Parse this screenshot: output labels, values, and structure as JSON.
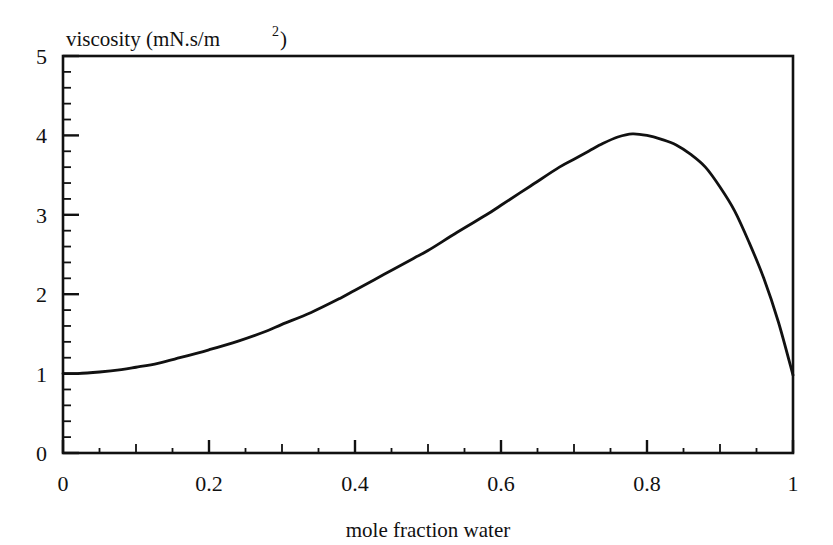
{
  "chart_data": {
    "type": "line",
    "title_main": "viscosity (mN.s/m",
    "title_sup": "2",
    "title_tail": ")",
    "xlabel": "mole fraction water",
    "ylabel": "viscosity (mN.s/m2)",
    "xlim": [
      0,
      1
    ],
    "ylim": [
      0,
      5
    ],
    "grid": false,
    "legend": "none",
    "line_color": "#111111",
    "background_color": "#ffffff",
    "frame_color": "#111111",
    "xticks": [
      0,
      0.2,
      0.4,
      0.6,
      0.8,
      1
    ],
    "xtick_labels": [
      "0",
      "0.2",
      "0.4",
      "0.6",
      "0.8",
      "1"
    ],
    "xminor_step": 0.05,
    "yticks": [
      0,
      1,
      2,
      3,
      4,
      5
    ],
    "ytick_labels": [
      "0",
      "1",
      "2",
      "3",
      "4",
      "5"
    ],
    "yminor_step": 0.2,
    "series": [
      {
        "name": "viscosity",
        "x": [
          0.0,
          0.02,
          0.05,
          0.08,
          0.1,
          0.13,
          0.16,
          0.2,
          0.24,
          0.28,
          0.3,
          0.34,
          0.38,
          0.4,
          0.44,
          0.48,
          0.5,
          0.54,
          0.58,
          0.6,
          0.64,
          0.68,
          0.7,
          0.72,
          0.74,
          0.76,
          0.78,
          0.8,
          0.82,
          0.84,
          0.86,
          0.88,
          0.9,
          0.92,
          0.94,
          0.96,
          0.98,
          1.0
        ],
        "y": [
          1.0,
          1.0,
          1.02,
          1.05,
          1.08,
          1.13,
          1.2,
          1.3,
          1.41,
          1.54,
          1.62,
          1.77,
          1.95,
          2.05,
          2.25,
          2.45,
          2.55,
          2.78,
          3.0,
          3.12,
          3.36,
          3.6,
          3.7,
          3.8,
          3.9,
          3.98,
          4.02,
          4.0,
          3.95,
          3.88,
          3.76,
          3.6,
          3.35,
          3.05,
          2.65,
          2.2,
          1.65,
          0.98
        ]
      }
    ],
    "annotations": []
  }
}
